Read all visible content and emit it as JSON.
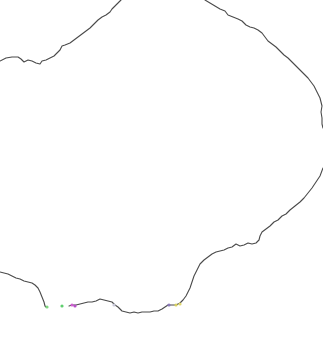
{
  "map": {
    "background": "#ffffff",
    "boundary_color": "#4a4a4a",
    "boundaries": [
      {
        "name": "upper-left-boundary",
        "points": "0,61 6,58 12,57 18,57 21,59 24,62 28,60 32,61 36,63 40,64 42,61 46,60 50,58 54,56 57,53 60,50 62,46 65,45 70,43 74,40 78,37 82,34 86,31 90,28 94,24 98,20 102,17 106,15 110,12 112,9 114,7 117,4 120,1 121,0"
      },
      {
        "name": "right-boundary",
        "points": "205,0 210,3 215,6 220,9 225,11 228,15 233,17 238,19 242,21 246,25 250,27 254,28 258,30 262,33 265,37 268,41 272,44 276,47 280,51 284,55 288,58 292,62 296,66 300,70 304,74 308,78 311,82 314,86 316,90 318,94 320,98 321,102 322,106 321,112 322,118 322,124 323,128"
      },
      {
        "name": "lower-right-boundary",
        "points": "323,168 320,176 316,182 312,188 308,193 304,198 300,202 295,206 290,210 286,214 282,216 278,220 274,222 270,226 266,229 262,232 260,236 259,240 256,243 252,244 248,243 244,245 240,246 236,244 232,247 228,248 224,250 220,251 216,252 212,254 208,257 204,260 200,264 197,270 194,276 192,282 190,288 188,292 186,296 183,300 180,303 176,305 172,305 168,305 165,307 162,309 158,311 154,311 150,312 146,312 142,312 138,313 134,312 130,313 126,312 122,311 120,309 118,307 115,305 112,302 108,301 104,300 100,299 96,301 92,302 88,302 84,303 80,304 76,305 72,305 69,306"
      },
      {
        "name": "lower-left-boundary",
        "points": "0,272 4,273 8,274 12,276 16,278 20,279 24,281 28,282 32,283 35,285 38,288 40,292 42,297 44,302 45,306 46,307"
      }
    ],
    "markers": [
      {
        "name": "green-marker",
        "x": 47,
        "y": 307,
        "color": "#7fd67f"
      },
      {
        "name": "green-marker-2",
        "x": 62,
        "y": 306,
        "color": "#5fcf6f"
      },
      {
        "name": "magenta-marker",
        "x": 72,
        "y": 305,
        "color": "#d05fd0"
      },
      {
        "name": "magenta-marker-2",
        "x": 75,
        "y": 306,
        "color": "#b84fc8"
      },
      {
        "name": "gray-marker",
        "x": 114,
        "y": 305,
        "color": "#c8c8d8"
      },
      {
        "name": "purple-marker",
        "x": 169,
        "y": 305,
        "color": "#8a78b8"
      },
      {
        "name": "yellow-marker",
        "x": 176,
        "y": 305,
        "color": "#d8d060"
      },
      {
        "name": "yellow-marker-2",
        "x": 180,
        "y": 304,
        "color": "#e0d870"
      }
    ]
  }
}
